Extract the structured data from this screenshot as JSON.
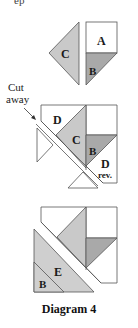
{
  "top_fragment": "ep",
  "diagram": {
    "caption": "Diagram 4",
    "cut_away_label": [
      "Cut",
      "away"
    ],
    "colors": {
      "outline": "#555555",
      "light_gray": "#c9c9c9",
      "mid_gray": "#a9a9a9",
      "white": "#ffffff"
    },
    "step1": {
      "pieces": [
        {
          "label": "C",
          "shape": "triangle",
          "fill": "light_gray"
        },
        {
          "label": "A",
          "shape": "square",
          "fill": "white"
        },
        {
          "label": "B",
          "shape": "triangle",
          "fill": "mid_gray"
        }
      ]
    },
    "step2": {
      "pieces": [
        {
          "label": "D",
          "shape": "triangle",
          "fill": "white"
        },
        {
          "label": "C",
          "shape": "triangle",
          "fill": "light_gray"
        },
        {
          "label": "B",
          "shape": "triangle",
          "fill": "mid_gray"
        },
        {
          "label": "D",
          "sublabel": "rev.",
          "shape": "triangle",
          "fill": "white"
        }
      ]
    },
    "step3": {
      "pieces": [
        {
          "label": "E",
          "shape": "triangle",
          "fill": "light_gray"
        },
        {
          "label": "B",
          "shape": "triangle",
          "fill": "light_gray"
        }
      ]
    }
  }
}
